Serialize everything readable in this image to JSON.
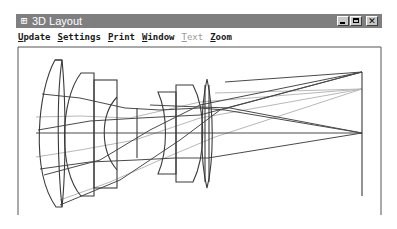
{
  "window": {
    "title": "3D Layout",
    "app_icon": "zemax-app-icon",
    "controls": {
      "minimize": "minimize-button",
      "maximize": "maximize-button",
      "close": "close-button",
      "close_glyph": "✕"
    }
  },
  "menu": {
    "items": [
      {
        "label": "Update",
        "accel": "U",
        "rest": "pdate",
        "enabled": true
      },
      {
        "label": "Settings",
        "accel": "S",
        "rest": "ettings",
        "enabled": true
      },
      {
        "label": "Print",
        "accel": "P",
        "rest": "rint",
        "enabled": true
      },
      {
        "label": "Window",
        "accel": "W",
        "rest": "indow",
        "enabled": true
      },
      {
        "label": "Text",
        "accel": "T",
        "rest": "ext",
        "enabled": false
      },
      {
        "label": "Zoom",
        "accel": "Z",
        "rest": "oom",
        "enabled": true
      }
    ]
  },
  "layout_view": {
    "description": "Optical system 3D layout: multi-element lens with ray fans to image plane",
    "colors": {
      "lens_outline": "#3a3a3a",
      "ray_primary": "#4a4a4a",
      "ray_secondary": "#b8b8b8",
      "frame": "#555555"
    },
    "field_count": 3,
    "image_plane_points": [
      "top-field",
      "mid-field",
      "on-axis"
    ]
  }
}
